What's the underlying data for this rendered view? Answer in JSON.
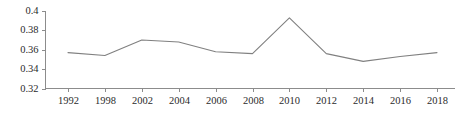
{
  "chart_data": {
    "type": "line",
    "title": "",
    "subtitle": "",
    "xlabel": "",
    "ylabel": "",
    "categories": [
      "1992",
      "1998",
      "2002",
      "2004",
      "2006",
      "2008",
      "2010",
      "2012",
      "2014",
      "2016",
      "2018"
    ],
    "values": [
      0.357,
      0.354,
      0.37,
      0.368,
      0.358,
      0.356,
      0.393,
      0.356,
      0.348,
      0.353,
      0.357
    ],
    "series": [
      {
        "name": "",
        "values": [
          0.357,
          0.354,
          0.37,
          0.368,
          0.358,
          0.356,
          0.393,
          0.356,
          0.348,
          0.353,
          0.357
        ]
      }
    ],
    "ylim": [
      0.32,
      0.4
    ],
    "yticks": [
      0.32,
      0.34,
      0.36,
      0.38,
      0.4
    ],
    "ytick_labels": [
      "0.32",
      "0.34",
      "0.36",
      "0.38",
      "0.4"
    ],
    "xtick_labels": [
      "1992",
      "1998",
      "2002",
      "2004",
      "2006",
      "2008",
      "2010",
      "2012",
      "2014",
      "2016",
      "2018"
    ],
    "grid": false,
    "legend": false,
    "legend_position": "none",
    "annotations": [],
    "line_color": "#808080",
    "axis_color": "#8c8c8c",
    "text_color": "#2b2b2b",
    "background_color": "#ffffff"
  }
}
